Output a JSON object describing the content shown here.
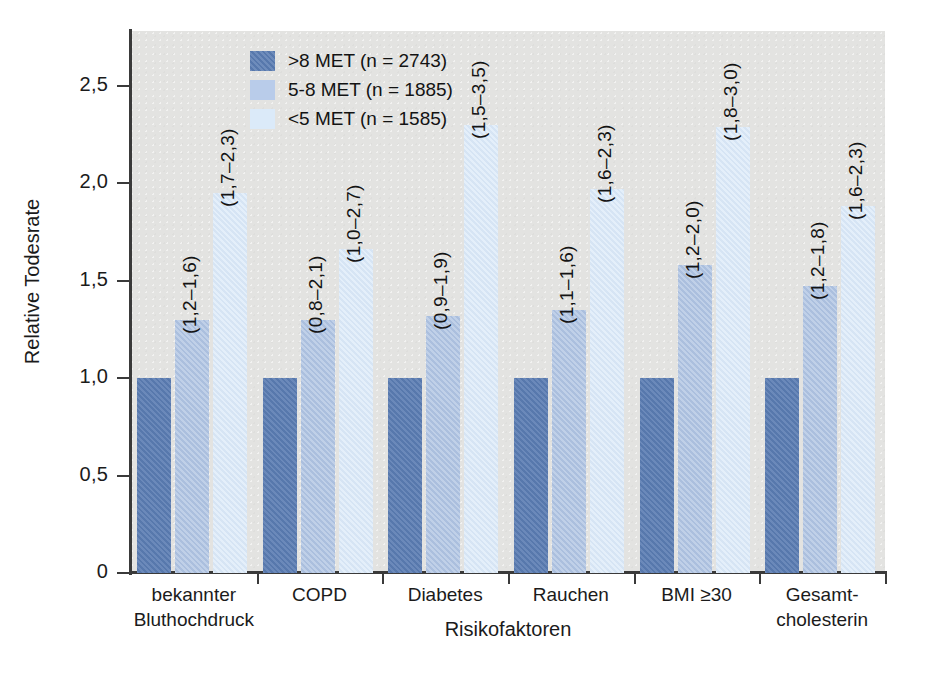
{
  "chart_data": {
    "type": "bar",
    "title": "",
    "xlabel": "Risikofaktoren",
    "ylabel": "Relative Todesrate",
    "categories": [
      "bekannter Bluthochdruck",
      "COPD",
      "Diabetes",
      "Rauchen",
      "BMI ≥30",
      "Gesamt-cholesterin"
    ],
    "category_lines": [
      [
        "bekannter",
        "Bluthochdruck"
      ],
      [
        "COPD"
      ],
      [
        "Diabetes"
      ],
      [
        "Rauchen"
      ],
      [
        "BMI ≥30"
      ],
      [
        "Gesamt-",
        "cholesterin"
      ]
    ],
    "ylim": [
      0,
      2.78
    ],
    "yticks": [
      0,
      0.5,
      1.0,
      1.5,
      2.0,
      2.5
    ],
    "ytick_labels": [
      "0",
      "0,5",
      "1,0",
      "1,5",
      "2,0",
      "2,5"
    ],
    "grid": false,
    "legend_position": "top-left-inside",
    "series": [
      {
        "name": ">8 MET (n = 2743)",
        "color": "#5a7cb2",
        "values": [
          1.0,
          1.0,
          1.0,
          1.0,
          1.0,
          1.0
        ],
        "ci_labels": [
          "",
          "",
          "",
          "",
          "",
          ""
        ]
      },
      {
        "name": "5-8 MET (n = 1885)",
        "color": "#aec3e2",
        "values": [
          1.3,
          1.3,
          1.32,
          1.35,
          1.58,
          1.47
        ],
        "ci_labels": [
          "(1,2–1,6)",
          "(0,8–2,1)",
          "(0,9–1,9)",
          "(1,1–1,6)",
          "(1,2–2,0)",
          "(1,2–1,8)"
        ]
      },
      {
        "name": "<5 MET (n = 1585)",
        "color": "#d9e8f8",
        "values": [
          1.95,
          1.66,
          2.3,
          1.97,
          2.29,
          1.88
        ],
        "ci_labels": [
          "(1,7–2,3)",
          "(1,0–2,7)",
          "(1,5–3,5)",
          "(1,6–2,3)",
          "(1,8–3,0)",
          "(1,6–2,3)"
        ]
      }
    ]
  },
  "legend": {
    "items": [
      {
        "label": ">8 MET (n = 2743)"
      },
      {
        "label": "5-8 MET (n = 1885)"
      },
      {
        "label": "<5 MET (n = 1585)"
      }
    ]
  }
}
